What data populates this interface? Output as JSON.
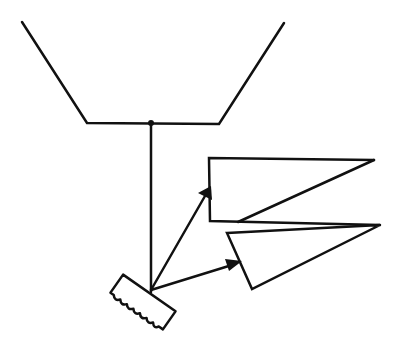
{
  "diagram": {
    "type": "line-drawing",
    "stroke_color": "#111111",
    "background": "#ffffff",
    "elements": {
      "funnel": {
        "points": [
          [
            22,
            22
          ],
          [
            87,
            123
          ],
          [
            219,
            124
          ],
          [
            284,
            23
          ]
        ]
      },
      "junction_dot": {
        "x": 151,
        "y": 123
      },
      "vertical_line": {
        "x1": 151,
        "y1": 124,
        "x2": 151,
        "y2": 290
      },
      "source_block": {
        "center": [
          143,
          301
        ],
        "angle": 35
      },
      "arrow_upper": {
        "from": [
          151,
          290
        ],
        "to": [
          210,
          187
        ]
      },
      "arrow_lower": {
        "from": [
          151,
          290
        ],
        "to": [
          240,
          262
        ]
      },
      "shape_upper": {
        "points": [
          [
            209,
            158
          ],
          [
            374,
            160
          ],
          [
            238,
            222
          ],
          [
            210,
            221
          ]
        ]
      },
      "shape_lower": {
        "points": [
          [
            227,
            233
          ],
          [
            380,
            225
          ],
          [
            252,
            289
          ]
        ]
      }
    }
  }
}
